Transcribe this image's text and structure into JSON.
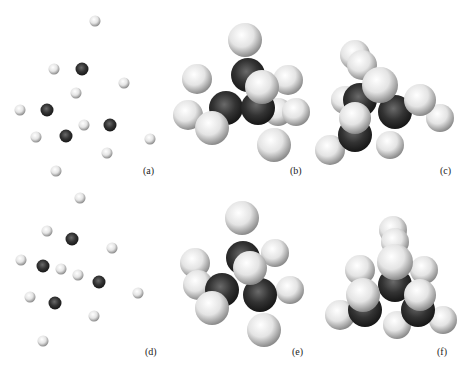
{
  "figure": {
    "panels": [
      {
        "id": "a",
        "label": "(a)",
        "view": "ball model"
      },
      {
        "id": "b",
        "label": "(b)",
        "view": "space-filling front"
      },
      {
        "id": "c",
        "label": "(c)",
        "view": "space-filling top"
      },
      {
        "id": "d",
        "label": "(d)",
        "view": "ball model"
      },
      {
        "id": "e",
        "label": "(e)",
        "view": "space-filling front"
      },
      {
        "id": "f",
        "label": "(f)",
        "view": "space-filling top"
      }
    ],
    "colors": {
      "light_atom": "#f2f2f2",
      "dark_atom": "#303030",
      "background": "#ffffff"
    }
  }
}
